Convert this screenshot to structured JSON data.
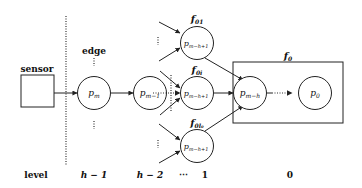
{
  "diagram": {
    "type": "hierarchical-pipeline",
    "sensor": {
      "label": "sensor"
    },
    "edge_label": "edge",
    "nodes": {
      "pm": {
        "base": "p",
        "sub": "m"
      },
      "pm1": {
        "base": "p",
        "sub": "m−1"
      },
      "top": {
        "base": "p",
        "sub": "m−h+1",
        "group": {
          "base": "f",
          "sub": "01"
        }
      },
      "mid": {
        "base": "p",
        "sub": "m−h+1",
        "group": {
          "base": "f",
          "sub": "0i"
        }
      },
      "bot": {
        "base": "p",
        "sub": "m−h+1",
        "group": {
          "base": "f",
          "sub": "0l₀"
        }
      },
      "pmh": {
        "base": "p",
        "sub": "m−h"
      },
      "p0": {
        "base": "p",
        "sub": "0"
      }
    },
    "box_label": {
      "base": "f",
      "sub": "0"
    },
    "ellipsis_vertical": "⋮",
    "ellipsis_horizontal": "⋯",
    "levels": {
      "title": "level",
      "items": [
        "h − 1",
        "h − 2",
        "⋯",
        "1",
        "0"
      ]
    }
  }
}
